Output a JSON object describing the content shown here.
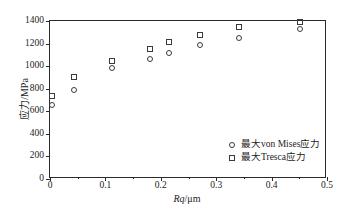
{
  "chart_data": {
    "type": "scatter",
    "title": "",
    "xlabel": "Rq/μm",
    "ylabel": "应力/MPa",
    "xlim": [
      0,
      0.5
    ],
    "ylim": [
      0,
      1400
    ],
    "grid": false,
    "legend_position": "lower-right",
    "xticks": [
      {
        "value": 0,
        "label": "0"
      },
      {
        "value": 0.1,
        "label": "0.1"
      },
      {
        "value": 0.2,
        "label": "0.2"
      },
      {
        "value": 0.3,
        "label": "0.3"
      },
      {
        "value": 0.4,
        "label": "0.4"
      },
      {
        "value": 0.5,
        "label": "0.5"
      }
    ],
    "xminor": [
      0.05,
      0.15,
      0.25,
      0.35,
      0.45
    ],
    "yticks": [
      {
        "value": 0,
        "label": "0"
      },
      {
        "value": 200,
        "label": "200"
      },
      {
        "value": 400,
        "label": "400"
      },
      {
        "value": 600,
        "label": "600"
      },
      {
        "value": 800,
        "label": "800"
      },
      {
        "value": 1000,
        "label": "1000"
      },
      {
        "value": 1200,
        "label": "1200"
      },
      {
        "value": 1400,
        "label": "1400"
      }
    ],
    "series": [
      {
        "name": "最大von Mises应力",
        "marker": "circle",
        "color": "#3a3a3a",
        "points": [
          {
            "x": 0.003,
            "y": 660
          },
          {
            "x": 0.044,
            "y": 790
          },
          {
            "x": 0.112,
            "y": 985
          },
          {
            "x": 0.18,
            "y": 1065
          },
          {
            "x": 0.214,
            "y": 1115
          },
          {
            "x": 0.27,
            "y": 1185
          },
          {
            "x": 0.341,
            "y": 1245
          },
          {
            "x": 0.451,
            "y": 1330
          }
        ]
      },
      {
        "name": "最大Tresca应力",
        "marker": "square",
        "color": "#3a3a3a",
        "points": [
          {
            "x": 0.003,
            "y": 735
          },
          {
            "x": 0.044,
            "y": 900
          },
          {
            "x": 0.112,
            "y": 1045
          },
          {
            "x": 0.18,
            "y": 1150
          },
          {
            "x": 0.214,
            "y": 1212
          },
          {
            "x": 0.27,
            "y": 1278
          },
          {
            "x": 0.341,
            "y": 1345
          },
          {
            "x": 0.451,
            "y": 1392
          }
        ]
      }
    ]
  },
  "legend": {
    "items": [
      {
        "marker": "circle",
        "label": "最大von Mises应力"
      },
      {
        "marker": "square",
        "label": "最大Tresca应力"
      }
    ]
  },
  "axes": {
    "x_title": "Rq/μm",
    "x_title_italic": "Rq",
    "x_title_rest": "/μm",
    "y_title": "应力/MPa"
  }
}
